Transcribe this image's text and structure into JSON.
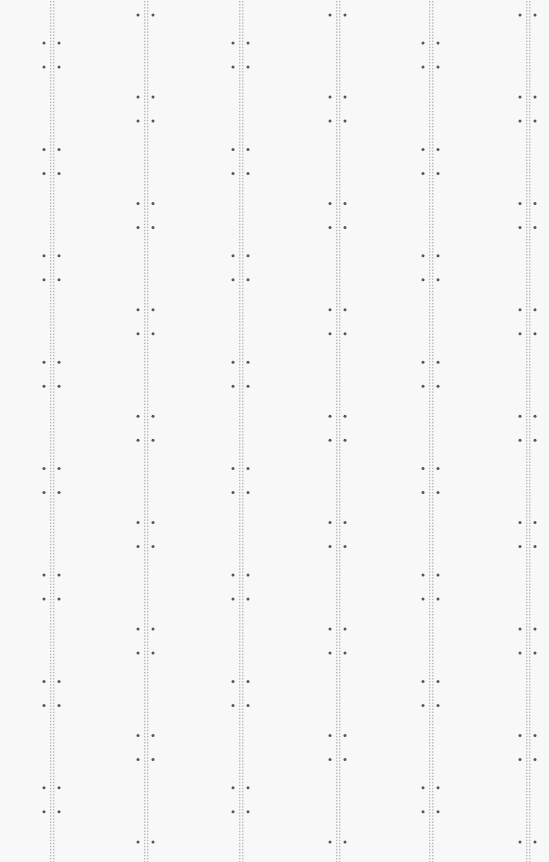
{
  "pattern": {
    "name": "dotted-ladder-columns",
    "column_count": 6,
    "columns": [
      {
        "id": 1,
        "marker_group": "A"
      },
      {
        "id": 2,
        "marker_group": "B"
      },
      {
        "id": 3,
        "marker_group": "A"
      },
      {
        "id": 4,
        "marker_group": "B"
      },
      {
        "id": 5,
        "marker_group": "A"
      },
      {
        "id": 6,
        "marker_group": "B"
      }
    ],
    "marker_pairs_per_column": 8,
    "colors": {
      "background": "#f8f8f8",
      "track_dot": "#b8b8b8",
      "marker_dot": "#555555"
    }
  }
}
